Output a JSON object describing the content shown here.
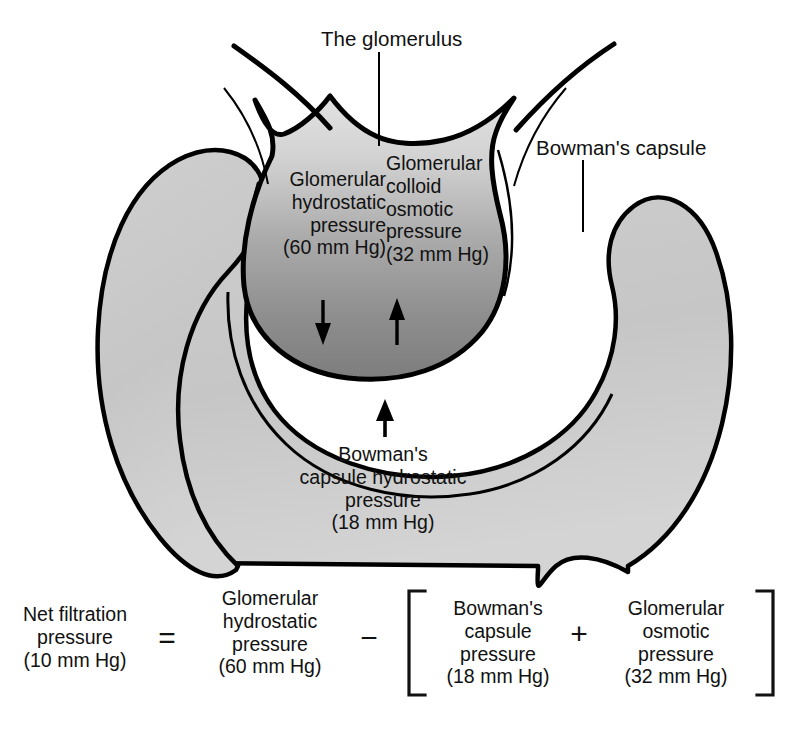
{
  "diagram": {
    "callouts": {
      "glomerulus": "The glomerulus",
      "bowmans_capsule": "Bowman's capsule",
      "glomerular_hydrostatic": "Glomerular\nhydrostatic\npressure\n(60 mm Hg)",
      "glomerular_colloid_osmotic": "Glomerular\ncolloid\nosmotic\npressure\n(32 mm Hg)",
      "bowmans_capsule_hydrostatic": "Bowman's\ncapsule hydrostatic\npressure\n(18 mm Hg)"
    },
    "pressures": [
      {
        "name": "Glomerular hydrostatic pressure",
        "value": 60,
        "unit": "mm Hg"
      },
      {
        "name": "Glomerular colloid osmotic pressure",
        "value": 32,
        "unit": "mm Hg"
      },
      {
        "name": "Bowman's capsule hydrostatic pressure",
        "value": 18,
        "unit": "mm Hg"
      },
      {
        "name": "Net filtration pressure",
        "value": 10,
        "unit": "mm Hg"
      }
    ],
    "arrows": {
      "glomerular_hydrostatic_arrow": "down-arrow",
      "glomerular_osmotic_arrow": "up-arrow",
      "bowmans_capsule_arrow": "up-arrow"
    },
    "colors": {
      "outline": "#000000",
      "capsule_fill": "#c9c9c9",
      "glomerulus_fill_top": "#d6d6d6",
      "glomerulus_fill_bottom": "#8a8a8a",
      "background": "#ffffff",
      "text": "#111111"
    }
  },
  "equation": {
    "terms": {
      "net_filtration": "Net filtration\npressure\n(10 mm Hg)",
      "glomerular_hydrostatic": "Glomerular\nhydrostatic\npressure\n(60 mm Hg)",
      "bowmans_capsule": "Bowman's\ncapsule\npressure\n(18 mm Hg)",
      "glomerular_osmotic": "Glomerular\nosmotic\npressure\n(32 mm Hg)"
    },
    "operators": {
      "equals": "=",
      "minus": "−",
      "plus": "+"
    },
    "bracket": {
      "left": "[",
      "right": "]"
    }
  }
}
